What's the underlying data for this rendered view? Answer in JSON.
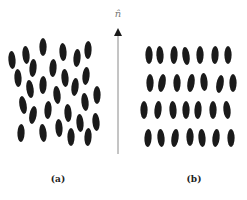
{
  "figure": {
    "director_label": "n̂",
    "captions": {
      "a": "(a)",
      "b": "(b)"
    },
    "colors": {
      "molecule": "#1a1a1a",
      "arrow": "#8a8a8a",
      "background": "#ffffff"
    },
    "molecule_size": {
      "rx": 3.6,
      "ry": 9
    },
    "arrow": {
      "x": 118,
      "y_top": 28,
      "y_bottom": 154
    },
    "panel_a_nematic": [
      [
        12,
        60,
        -4
      ],
      [
        26,
        55,
        -5
      ],
      [
        43,
        47,
        0
      ],
      [
        63,
        52,
        -3
      ],
      [
        77,
        58,
        4
      ],
      [
        88,
        50,
        2
      ],
      [
        18,
        78,
        -3
      ],
      [
        33,
        68,
        4
      ],
      [
        53,
        68,
        3
      ],
      [
        65,
        78,
        -4
      ],
      [
        86,
        76,
        5
      ],
      [
        30,
        89,
        -8
      ],
      [
        43,
        85,
        2
      ],
      [
        57,
        95,
        -6
      ],
      [
        75,
        87,
        6
      ],
      [
        97,
        95,
        0
      ],
      [
        23,
        105,
        -10
      ],
      [
        33,
        115,
        10
      ],
      [
        48,
        110,
        3
      ],
      [
        68,
        113,
        -3
      ],
      [
        85,
        102,
        -6
      ],
      [
        96,
        122,
        -5
      ],
      [
        21,
        133,
        2
      ],
      [
        43,
        133,
        -6
      ],
      [
        59,
        128,
        -3
      ],
      [
        71,
        137,
        0
      ],
      [
        80,
        123,
        -4
      ],
      [
        88,
        137,
        3
      ]
    ],
    "panel_b_smectic": [
      [
        149,
        55,
        0
      ],
      [
        160,
        55,
        -3
      ],
      [
        174,
        55,
        2
      ],
      [
        186,
        56,
        -8
      ],
      [
        200,
        55,
        0
      ],
      [
        215,
        55,
        2
      ],
      [
        228,
        55,
        0
      ],
      [
        150,
        83,
        0
      ],
      [
        162,
        83,
        10
      ],
      [
        177,
        83,
        0
      ],
      [
        191,
        83,
        8
      ],
      [
        204,
        82,
        -4
      ],
      [
        220,
        84,
        10
      ],
      [
        233,
        83,
        0
      ],
      [
        144,
        110,
        0
      ],
      [
        158,
        110,
        5
      ],
      [
        173,
        110,
        -3
      ],
      [
        186,
        110,
        0
      ],
      [
        198,
        110,
        3
      ],
      [
        213,
        110,
        0
      ],
      [
        227,
        110,
        -6
      ],
      [
        148,
        138,
        3
      ],
      [
        161,
        138,
        -5
      ],
      [
        175,
        138,
        8
      ],
      [
        190,
        137,
        0
      ],
      [
        202,
        138,
        -4
      ],
      [
        216,
        138,
        6
      ],
      [
        231,
        138,
        0
      ]
    ]
  }
}
